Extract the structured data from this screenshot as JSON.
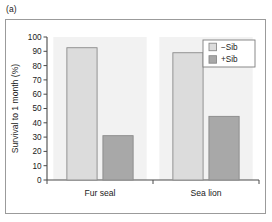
{
  "figure": {
    "panel_label": "(a)",
    "background_color": "#ffffff",
    "frame_color": "#9b9b9b"
  },
  "chart_data": {
    "type": "bar",
    "title": "",
    "subtitle": "",
    "xlabel": "",
    "ylabel": "Survival to 1 month (%)",
    "categories": [
      "Fur seal",
      "Sea lion"
    ],
    "series": [
      {
        "name": "−Sib",
        "values": [
          92.5,
          89.0
        ],
        "color": "#dcdcdc",
        "edge_color": "#8a8a8a"
      },
      {
        "name": "+Sib",
        "values": [
          31.0,
          44.5
        ],
        "color": "#a8a8a8",
        "edge_color": "#8a8a8a"
      }
    ],
    "ylim": [
      0,
      100
    ],
    "yticks": [
      0,
      10,
      20,
      30,
      40,
      50,
      60,
      70,
      80,
      90,
      100
    ],
    "ytick_labels": [
      "0",
      "10",
      "20",
      "30",
      "40",
      "50",
      "60",
      "70",
      "80",
      "90",
      "100"
    ],
    "grid": false,
    "legend_position": "upper right",
    "legend_entries": [
      "−Sib",
      "+Sib"
    ],
    "group_band_color": "#f2f2f2",
    "axis_color": "#4a4a4a"
  }
}
